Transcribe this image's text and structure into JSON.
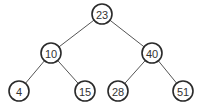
{
  "diagram": {
    "type": "binary-search-tree",
    "colors": {
      "background": "#ffffff",
      "node_stroke": "#2a2a2a",
      "edge": "#555555",
      "text": "#333333"
    },
    "nodes": [
      {
        "id": "n23",
        "label": "23",
        "x": 102,
        "y": 14
      },
      {
        "id": "n10",
        "label": "10",
        "x": 51,
        "y": 53
      },
      {
        "id": "n40",
        "label": "40",
        "x": 152,
        "y": 53
      },
      {
        "id": "n4",
        "label": "4",
        "x": 19,
        "y": 91
      },
      {
        "id": "n15",
        "label": "15",
        "x": 85,
        "y": 91
      },
      {
        "id": "n28",
        "label": "28",
        "x": 118,
        "y": 91
      },
      {
        "id": "n51",
        "label": "51",
        "x": 183,
        "y": 91
      }
    ],
    "edges": [
      {
        "from": "n23",
        "to": "n10"
      },
      {
        "from": "n23",
        "to": "n40"
      },
      {
        "from": "n10",
        "to": "n4"
      },
      {
        "from": "n10",
        "to": "n15"
      },
      {
        "from": "n40",
        "to": "n28"
      },
      {
        "from": "n40",
        "to": "n51"
      }
    ],
    "node_radius": 10
  }
}
